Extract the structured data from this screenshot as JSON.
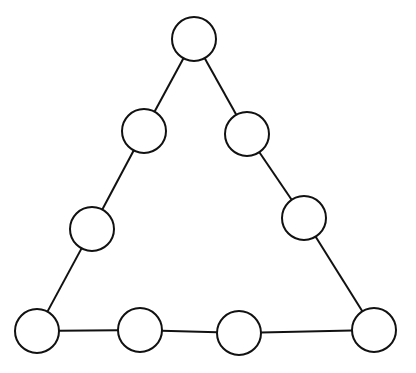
{
  "diagram": {
    "type": "triangle-node-graph",
    "width": 416,
    "height": 373,
    "stroke_color": "#111111",
    "fill_color": "#ffffff",
    "background": "#ffffff",
    "node_radius": 22,
    "stroke_width": 2,
    "nodes": [
      {
        "id": "top",
        "cx": 194,
        "cy": 39
      },
      {
        "id": "left-upper",
        "cx": 144,
        "cy": 131
      },
      {
        "id": "right-upper",
        "cx": 247,
        "cy": 134
      },
      {
        "id": "left-lower",
        "cx": 92,
        "cy": 229
      },
      {
        "id": "right-lower",
        "cx": 304,
        "cy": 218
      },
      {
        "id": "bottom-left",
        "cx": 37,
        "cy": 331
      },
      {
        "id": "bottom-2",
        "cx": 140,
        "cy": 330
      },
      {
        "id": "bottom-3",
        "cx": 239,
        "cy": 333
      },
      {
        "id": "bottom-right",
        "cx": 374,
        "cy": 330
      }
    ],
    "edges": [
      [
        "top",
        "left-upper"
      ],
      [
        "left-upper",
        "left-lower"
      ],
      [
        "left-lower",
        "bottom-left"
      ],
      [
        "top",
        "right-upper"
      ],
      [
        "right-upper",
        "right-lower"
      ],
      [
        "right-lower",
        "bottom-right"
      ],
      [
        "bottom-left",
        "bottom-2"
      ],
      [
        "bottom-2",
        "bottom-3"
      ],
      [
        "bottom-3",
        "bottom-right"
      ]
    ]
  }
}
